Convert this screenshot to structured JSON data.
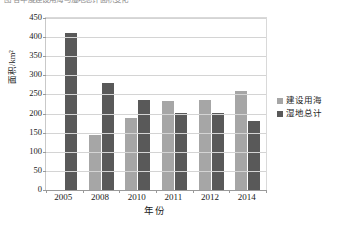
{
  "caption": {
    "clipped_text": "图  各年度建设用海与湿地总计面积变化"
  },
  "chart_data": {
    "type": "bar",
    "title": "",
    "subtitle": "",
    "xlabel": "年份",
    "ylabel": "面积/km²",
    "categories": [
      "2005",
      "2008",
      "2010",
      "2011",
      "2012",
      "2014"
    ],
    "series": [
      {
        "name": "建设用海",
        "color": "#a6a6a6",
        "values": [
          null,
          143,
          188,
          233,
          235,
          258
        ]
      },
      {
        "name": "湿地总计",
        "color": "#595959",
        "values": [
          412,
          280,
          235,
          201,
          202,
          180
        ]
      }
    ],
    "ylim": [
      0,
      450
    ],
    "ytick_step": 50,
    "yticks": [
      "0",
      "50",
      "100",
      "150",
      "200",
      "250",
      "300",
      "350",
      "400",
      "450"
    ],
    "grid": "horizontal",
    "legend_position": "right"
  }
}
